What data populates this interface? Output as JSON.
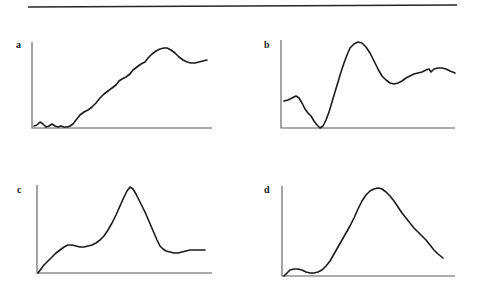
{
  "figure": {
    "background_color": "#ffffff",
    "ink_color": "#1b1b1b",
    "axis_color": "#5a5a5a",
    "top_rule": {
      "name": "horizontal-rule",
      "x1": 28,
      "y1": 7,
      "x2": 457,
      "y2": 5,
      "color": "#262626"
    },
    "panels": [
      {
        "label": "a",
        "label_x": 16,
        "label_y": 40,
        "axis": {
          "x": 32,
          "y_top": 42,
          "y_base": 128,
          "x_right": 212
        },
        "curve_path": "M 34,126 L 37,125 L 40,122 L 43,124 L 46,127 L 49,126 L 52,124 L 55,126 L 58,127 L 61,126 L 64,127 L 67,127 L 70,126 L 73,124 L 76,120 L 80,115 L 84,112 L 88,110 L 92,107 L 96,103 L 100,98 L 104,94 L 108,91 L 112,88 L 116,85 L 119,81 L 122,79 L 126,77 L 130,74 L 133,70 L 137,67 L 141,64 L 145,62 L 148,58 L 152,54 L 156,51 L 160,49 L 164,48 L 167,48 L 171,50 L 175,53 L 179,57 L 183,60 L 187,62 L 191,63 L 195,63 L 199,62 L 203,61 L 207,60"
      },
      {
        "label": "b",
        "label_x": 264,
        "label_y": 40,
        "axis": {
          "x": 281,
          "y_top": 40,
          "y_base": 128,
          "x_right": 455
        },
        "curve_path": "M 284,101 L 288,100 L 292,98 L 296,96 L 299,98 L 302,103 L 305,109 L 308,113 L 311,116 L 314,121 L 317,125 L 320,128 L 323,126 L 326,120 L 329,112 L 332,102 L 335,92 L 338,82 L 341,72 L 344,63 L 347,55 L 350,48 L 354,44 L 358,42 L 362,43 L 366,47 L 370,53 L 374,61 L 378,69 L 382,76 L 386,80 L 390,83 L 394,84 L 398,83 L 402,81 L 406,78 L 410,76 L 414,74 L 418,73 L 422,72 L 426,70 L 429,69 L 431,72 L 434,69 L 438,68 L 442,68 L 446,69 L 450,71 L 455,73"
      },
      {
        "label": "c",
        "label_x": 17,
        "label_y": 185,
        "axis": {
          "x": 37,
          "y_top": 185,
          "y_base": 273,
          "x_right": 212
        },
        "curve_path": "M 38,273 L 41,269 L 44,265 L 48,261 L 52,257 L 56,253 L 60,250 L 64,247 L 68,245 L 72,245 L 76,246 L 80,247 L 84,247 L 88,246 L 92,245 L 96,243 L 100,240 L 104,236 L 108,230 L 112,223 L 116,215 L 120,206 L 124,197 L 127,191 L 130,187 L 133,189 L 136,194 L 139,200 L 142,206 L 145,212 L 148,219 L 151,226 L 154,233 L 157,240 L 160,246 L 163,249 L 166,251 L 170,252 L 174,253 L 178,253 L 182,252 L 186,251 L 190,250 L 195,250 L 200,250 L 205,250"
      },
      {
        "label": "d",
        "label_x": 264,
        "label_y": 185,
        "axis": {
          "x": 282,
          "y_top": 186,
          "y_base": 276,
          "x_right": 455
        },
        "curve_path": "M 284,276 L 287,273 L 290,270 L 294,269 L 298,269 L 302,270 L 306,272 L 310,273 L 314,273 L 318,272 L 322,270 L 326,266 L 330,261 L 334,254 L 338,247 L 342,240 L 346,233 L 350,226 L 354,218 L 358,209 L 362,201 L 366,195 L 370,191 L 374,189 L 378,188 L 382,189 L 386,192 L 390,196 L 394,201 L 398,207 L 402,213 L 406,218 L 410,223 L 414,228 L 418,232 L 422,236 L 426,240 L 430,245 L 434,250 L 438,254 L 443,258"
      }
    ]
  },
  "chart_data": [
    {
      "type": "line",
      "title": "",
      "panel": "a",
      "xlabel": "",
      "ylabel": "",
      "grid": false,
      "legend": "none",
      "axis_ticks": [],
      "description": "Low noisy baseline, then steady monotonic rise to a rounded maximum near 70% of the x-range, followed by a small decline to a flat shoulder at the right edge.",
      "x": [
        0,
        4,
        8,
        12,
        16,
        20,
        24,
        28,
        32,
        36,
        40,
        44,
        48,
        52,
        56,
        60,
        64,
        68,
        72,
        76,
        80,
        84,
        88,
        92,
        96,
        100
      ],
      "values": [
        2,
        4,
        3,
        2,
        3,
        2,
        3,
        6,
        11,
        17,
        23,
        29,
        35,
        40,
        45,
        50,
        55,
        61,
        67,
        74,
        82,
        90,
        93,
        86,
        78,
        77
      ]
    },
    {
      "type": "line",
      "title": "",
      "panel": "b",
      "xlabel": "",
      "ylabel": "",
      "grid": false,
      "legend": "none",
      "axis_ticks": [],
      "description": "Starts mid-height with a small bump, falls to zero at about 24% of the x-range, then a large sharp peak near 44%, a fall to a trough near 67%, and a slightly wavy plateau to the right edge.",
      "x": [
        0,
        4,
        8,
        12,
        16,
        20,
        24,
        28,
        32,
        36,
        40,
        44,
        48,
        52,
        56,
        60,
        64,
        68,
        72,
        76,
        80,
        84,
        88,
        92,
        96,
        100
      ],
      "values": [
        31,
        33,
        36,
        29,
        19,
        10,
        0,
        18,
        42,
        66,
        86,
        98,
        96,
        82,
        64,
        52,
        48,
        50,
        55,
        59,
        63,
        67,
        65,
        68,
        66,
        63
      ]
    },
    {
      "type": "line",
      "title": "",
      "panel": "c",
      "xlabel": "",
      "ylabel": "",
      "grid": false,
      "legend": "none",
      "axis_ticks": [],
      "description": "Rises from zero to a shoulder plateau at about one third height, then a tall narrow symmetric peak near 53% of the x-range, falling back to a flat low tail.",
      "x": [
        0,
        4,
        8,
        12,
        16,
        20,
        24,
        28,
        32,
        36,
        40,
        44,
        48,
        52,
        56,
        60,
        64,
        68,
        72,
        76,
        80,
        84,
        88,
        92,
        96,
        100
      ],
      "values": [
        0,
        9,
        18,
        26,
        31,
        32,
        31,
        31,
        33,
        38,
        47,
        62,
        80,
        96,
        88,
        70,
        52,
        38,
        29,
        25,
        24,
        24,
        25,
        25,
        25,
        25
      ]
    },
    {
      "type": "line",
      "title": "",
      "panel": "d",
      "xlabel": "",
      "ylabel": "",
      "grid": false,
      "legend": "none",
      "axis_ticks": [],
      "description": "Flat near zero with a small early bump, then a broad asymmetric rise to a rounded maximum near 55% of the x-range, followed by a long steady decline that is still falling at the right edge.",
      "x": [
        0,
        4,
        8,
        12,
        16,
        20,
        24,
        28,
        32,
        36,
        40,
        44,
        48,
        52,
        56,
        60,
        64,
        68,
        72,
        76,
        80,
        84,
        88,
        92,
        96,
        100
      ],
      "values": [
        0,
        7,
        8,
        5,
        4,
        5,
        9,
        17,
        27,
        38,
        51,
        64,
        79,
        90,
        97,
        96,
        90,
        83,
        75,
        68,
        60,
        53,
        45,
        37,
        29,
        21
      ]
    }
  ]
}
